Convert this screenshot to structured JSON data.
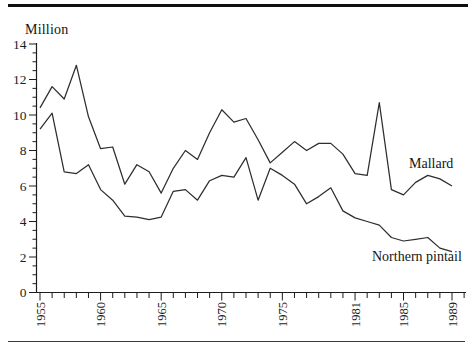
{
  "figure": {
    "y_axis_title": "Million"
  },
  "chart_data": {
    "type": "line",
    "title": "",
    "xlabel": "",
    "ylabel": "Million",
    "ylim": [
      0,
      14
    ],
    "y_major_ticks": [
      0,
      2,
      4,
      6,
      8,
      10,
      12,
      14
    ],
    "y_minor_tick_step": 0.5,
    "grid": false,
    "legend_position": "inline-labels-on-lines",
    "line_color": "#2e2e2e",
    "x_tick_every_year": true,
    "x_axis_last_tick_year": 1990,
    "x_labeled_ticks": [
      1955,
      1960,
      1965,
      1970,
      1975,
      1981,
      1985,
      1989
    ],
    "x_years": [
      1955,
      1956,
      1957,
      1958,
      1959,
      1960,
      1961,
      1962,
      1963,
      1964,
      1965,
      1966,
      1967,
      1968,
      1969,
      1970,
      1971,
      1972,
      1973,
      1974,
      1975,
      1976,
      1977,
      1978,
      1979,
      1980,
      1981,
      1982,
      1983,
      1984,
      1985,
      1986,
      1987,
      1988,
      1989
    ],
    "series": [
      {
        "name": "Mallard",
        "values": [
          10.4,
          11.6,
          10.9,
          12.8,
          9.9,
          8.1,
          8.2,
          6.1,
          7.2,
          6.8,
          5.6,
          7.0,
          8.0,
          7.5,
          9.0,
          10.3,
          9.6,
          9.8,
          8.6,
          7.3,
          7.9,
          8.5,
          8.0,
          8.4,
          8.4,
          7.8,
          6.7,
          6.6,
          10.7,
          5.8,
          5.5,
          6.2,
          6.6,
          6.4,
          6.0
        ]
      },
      {
        "name": "Northern pintail",
        "values": [
          9.2,
          10.1,
          6.8,
          6.7,
          7.2,
          5.8,
          5.2,
          4.3,
          4.25,
          4.1,
          4.25,
          5.7,
          5.8,
          5.2,
          6.3,
          6.6,
          6.5,
          7.6,
          5.2,
          7.0,
          6.6,
          6.1,
          5.0,
          5.4,
          5.9,
          4.6,
          4.2,
          4.0,
          3.8,
          3.1,
          2.9,
          3.0,
          3.1,
          2.5,
          2.3
        ]
      }
    ]
  }
}
